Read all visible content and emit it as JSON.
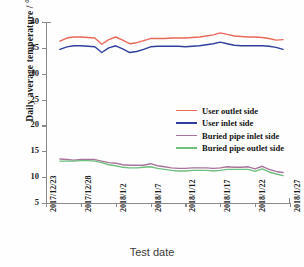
{
  "chart_data": {
    "type": "line",
    "title": "",
    "xlabel": "Test date",
    "ylabel": "Daily average temperature / °C",
    "ylim": [
      5,
      40
    ],
    "yticks": [
      5,
      10,
      15,
      20,
      25,
      30,
      35,
      40
    ],
    "grid": false,
    "legend_position": "center",
    "x_tick_labels": [
      "2017/12/23",
      "2017/12/28",
      "2018/1/2",
      "2018/1/7",
      "2018/1/12",
      "2018/1/17",
      "2018/1/22",
      "2018/1/27"
    ],
    "x": [
      "2017/12/25",
      "2017/12/26",
      "2017/12/27",
      "2017/12/28",
      "2017/12/29",
      "2017/12/30",
      "2017/12/31",
      "2018/1/1",
      "2018/1/2",
      "2018/1/3",
      "2018/1/4",
      "2018/1/5",
      "2018/1/6",
      "2018/1/7",
      "2018/1/8",
      "2018/1/9",
      "2018/1/10",
      "2018/1/11",
      "2018/1/12",
      "2018/1/13",
      "2018/1/14",
      "2018/1/15",
      "2018/1/16",
      "2018/1/17",
      "2018/1/18",
      "2018/1/19",
      "2018/1/20",
      "2018/1/21",
      "2018/1/22",
      "2018/1/23",
      "2018/1/24",
      "2018/1/25",
      "2018/1/26"
    ],
    "series": [
      {
        "name": "User outlet side",
        "color": "#e8685a",
        "values": [
          36.3,
          36.9,
          37.1,
          37.1,
          37.0,
          36.9,
          35.7,
          36.6,
          37.1,
          36.5,
          35.8,
          36.0,
          36.4,
          36.8,
          36.8,
          36.8,
          36.9,
          36.9,
          36.9,
          37.0,
          37.1,
          37.3,
          37.5,
          37.9,
          37.6,
          37.3,
          37.2,
          37.1,
          37.1,
          37.0,
          36.8,
          36.5,
          36.6
        ]
      },
      {
        "name": "User inlet side",
        "color": "#2f3f9e",
        "values": [
          34.7,
          35.2,
          35.4,
          35.4,
          35.3,
          35.2,
          34.1,
          35.0,
          35.4,
          34.8,
          34.1,
          34.3,
          34.7,
          35.2,
          35.3,
          35.3,
          35.3,
          35.3,
          35.2,
          35.3,
          35.4,
          35.6,
          35.8,
          36.1,
          35.8,
          35.5,
          35.4,
          35.4,
          35.4,
          35.4,
          35.3,
          35.1,
          34.7
        ]
      },
      {
        "name": "Buried pipe inlet side",
        "color": "#a8749c",
        "values": [
          13.5,
          13.4,
          13.3,
          13.4,
          13.4,
          13.4,
          13.1,
          12.8,
          12.7,
          12.4,
          12.3,
          12.3,
          12.3,
          12.6,
          12.2,
          12.0,
          11.8,
          11.7,
          11.7,
          11.8,
          11.8,
          11.8,
          11.7,
          11.8,
          12.0,
          11.9,
          11.9,
          12.0,
          11.6,
          12.1,
          11.5,
          11.1,
          10.9
        ]
      },
      {
        "name": "Buried pipe outlet side",
        "color": "#6fbf7e",
        "values": [
          13.1,
          13.1,
          13.1,
          13.2,
          13.2,
          13.1,
          12.8,
          12.4,
          12.2,
          11.9,
          11.8,
          11.8,
          11.9,
          12.0,
          11.7,
          11.5,
          11.3,
          11.2,
          11.2,
          11.3,
          11.3,
          11.3,
          11.2,
          11.3,
          11.5,
          11.5,
          11.5,
          11.5,
          11.1,
          11.6,
          11.0,
          10.6,
          10.3
        ]
      }
    ]
  },
  "legend": {
    "items": [
      {
        "label": "User outlet side",
        "color": "#e8685a"
      },
      {
        "label": "User inlet side",
        "color": "#2f3f9e"
      },
      {
        "label": "Buried pipe inlet side",
        "color": "#a8749c"
      },
      {
        "label": "Buried pipe outlet side",
        "color": "#6fbf7e"
      }
    ]
  }
}
